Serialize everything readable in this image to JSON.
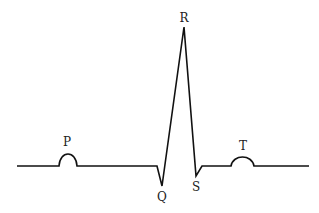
{
  "diagram": {
    "labels": {
      "p": "P",
      "q": "Q",
      "r": "R",
      "s": "S",
      "t": "T"
    },
    "colors": {
      "line": "#111111",
      "background": "#ffffff"
    }
  }
}
